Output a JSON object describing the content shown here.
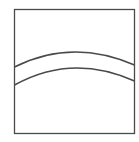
{
  "diagram": {
    "width": 139,
    "height": 142,
    "background": "#ffffff",
    "stroke_color": "#4a4a4a",
    "frame": {
      "x": 14.5,
      "y": 9.5,
      "width": 120,
      "height": 124,
      "stroke_width": 1.3
    },
    "curves": [
      {
        "name": "upper-arc",
        "d": "M 14.5 67 Q 72 38 134.5 65",
        "stroke_width": 1.5
      },
      {
        "name": "lower-arc",
        "d": "M 14.5 85 Q 72 53 134.5 81",
        "stroke_width": 1.5
      }
    ]
  }
}
